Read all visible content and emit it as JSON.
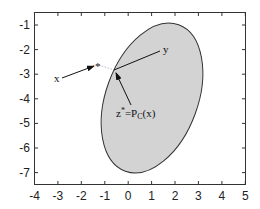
{
  "figure": {
    "type": "projection-onto-convex-set",
    "xaxis": {
      "range": [
        -4,
        5
      ],
      "ticks": [
        "-4",
        "-3",
        "-2",
        "-1",
        "0",
        "1",
        "2",
        "3",
        "4",
        "5"
      ]
    },
    "yaxis": {
      "range": [
        -7.5,
        -0.5
      ],
      "ticks": [
        "-1",
        "-2",
        "-3",
        "-4",
        "-5",
        "-6",
        "-7"
      ]
    },
    "set": {
      "name": "C",
      "shape": "ellipse",
      "fill": "#d3d3d3",
      "stroke": "#333333"
    },
    "labels": {
      "x": "x",
      "y": "y",
      "star": "*",
      "projection_prefix": "z",
      "projection_sup": "*",
      "projection_eq": "=P",
      "projection_sub": "C",
      "projection_arg": "(x)"
    },
    "colors": {
      "axis": "#333333",
      "arrow": "#111111",
      "dotted": "#aaaaaa",
      "ellipse_fill": "#d3d3d3"
    }
  }
}
